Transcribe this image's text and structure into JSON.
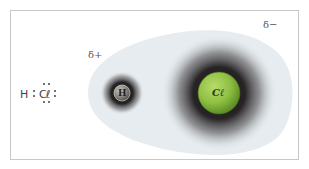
{
  "diagram": {
    "title": "",
    "lewis_structure": {
      "hydrogen": "H",
      "chlorine": "Cl",
      "chlorine_display": "Cℓ"
    },
    "charges": {
      "partial_positive": "δ+",
      "partial_negative": "δ−"
    },
    "atoms": [
      {
        "symbol": "H",
        "color": "#8a8a80",
        "position": "left"
      },
      {
        "symbol": "Cℓ",
        "color": "#8fc043",
        "position": "right"
      }
    ],
    "colors": {
      "cloud": "#e6ecef",
      "halo": "#1e1a1c",
      "frame": "#c8c8c8",
      "chlorine": "#8fc043",
      "hydrogen": "#8a8a80"
    }
  }
}
